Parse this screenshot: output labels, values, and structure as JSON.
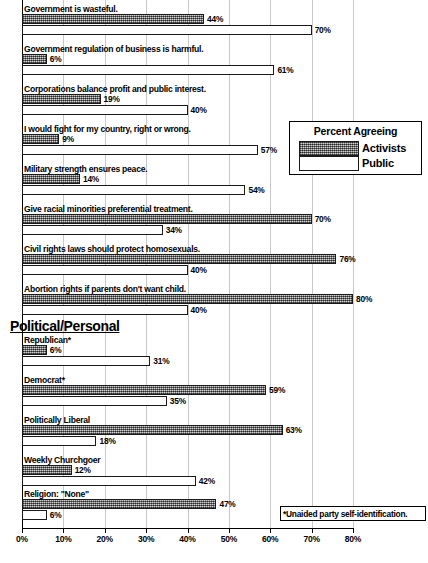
{
  "chart_data": {
    "type": "bar",
    "orientation": "horizontal",
    "title": "",
    "xlabel": "",
    "ylabel": "",
    "xlim": [
      0,
      80
    ],
    "grid": true,
    "grid_axis": "x",
    "legend": {
      "title": "Percent Agreeing",
      "position": "upper-right-inset",
      "entries": [
        {
          "name": "Activists",
          "fill": "hatched-gray",
          "color": "#9d9d9d"
        },
        {
          "name": "Public",
          "fill": "white",
          "color": "#ffffff"
        }
      ]
    },
    "x_ticks": [
      0,
      10,
      20,
      30,
      40,
      50,
      60,
      70,
      80
    ],
    "x_tick_labels": [
      "0%",
      "10%",
      "20%",
      "30%",
      "40%",
      "50%",
      "60%",
      "70%",
      "80%"
    ],
    "series": [
      {
        "name": "Activists",
        "values": [
          44,
          6,
          19,
          9,
          14,
          70,
          76,
          80,
          6,
          59,
          63,
          12,
          47
        ]
      },
      {
        "name": "Public",
        "values": [
          70,
          61,
          40,
          57,
          54,
          34,
          40,
          40,
          31,
          35,
          18,
          42,
          6
        ]
      }
    ],
    "categories": [
      "Government is wasteful.",
      "Government regulation of business is harmful.",
      "Corporations balance profit and public interest.",
      "I would fight for my country, right or wrong.",
      "Military strength ensures peace.",
      "Give racial minorities preferential treatment.",
      "Civil rights laws should protect homosexuals.",
      "Abortion rights if parents don't want child.",
      "Republican*",
      "Democrat*",
      "Politically Liberal",
      "Weekly Churchgoer",
      "Religion:  \"None\""
    ],
    "value_labels": {
      "activists": [
        "44%",
        "6%",
        "19%",
        "9%",
        "14%",
        "70%",
        "76%",
        "80%",
        "6%",
        "59%",
        "63%",
        "12%",
        "47%"
      ],
      "public": [
        "70%",
        "61%",
        "40%",
        "57%",
        "54%",
        "34%",
        "40%",
        "40%",
        "31%",
        "35%",
        "18%",
        "42%",
        "6%"
      ]
    },
    "section_headers": [
      {
        "label": "Political/Personal",
        "before_category_index": 8
      }
    ],
    "annotations": [
      {
        "name": "footnote",
        "text": "*Unaided party  self-identification."
      }
    ]
  },
  "rows": [
    {
      "label": "Government is wasteful.",
      "activists": 44,
      "public": 70,
      "activists_label": "44%",
      "public_label": "70%",
      "label_y": 4,
      "a_y": 14,
      "p_y": 25
    },
    {
      "label": "Government regulation of business is harmful.",
      "activists": 6,
      "public": 61,
      "activists_label": "6%",
      "public_label": "61%",
      "label_y": 44,
      "a_y": 54,
      "p_y": 65
    },
    {
      "label": "Corporations balance profit and public interest.",
      "activists": 19,
      "public": 40,
      "activists_label": "19%",
      "public_label": "40%",
      "label_y": 84,
      "a_y": 94,
      "p_y": 105
    },
    {
      "label": "I would fight for my country, right or wrong.",
      "activists": 9,
      "public": 57,
      "activists_label": "9%",
      "public_label": "57%",
      "label_y": 124,
      "a_y": 134,
      "p_y": 145
    },
    {
      "label": "Military strength ensures peace.",
      "activists": 14,
      "public": 54,
      "activists_label": "14%",
      "public_label": "54%",
      "label_y": 164,
      "a_y": 174,
      "p_y": 185
    },
    {
      "label": "Give racial minorities preferential treatment.",
      "activists": 70,
      "public": 34,
      "activists_label": "70%",
      "public_label": "34%",
      "label_y": 204,
      "a_y": 214,
      "p_y": 225
    },
    {
      "label": "Civil rights laws should protect homosexuals.",
      "activists": 76,
      "public": 40,
      "activists_label": "76%",
      "public_label": "40%",
      "label_y": 244,
      "a_y": 254,
      "p_y": 265
    },
    {
      "label": "Abortion rights if parents don't want child.",
      "activists": 80,
      "public": 40,
      "activists_label": "80%",
      "public_label": "40%",
      "label_y": 284,
      "a_y": 294,
      "p_y": 305
    },
    {
      "label": "Republican*",
      "activists": 6,
      "public": 31,
      "activists_label": "6%",
      "public_label": "31%",
      "label_y": 335,
      "a_y": 345,
      "p_y": 356
    },
    {
      "label": "Democrat*",
      "activists": 59,
      "public": 35,
      "activists_label": "59%",
      "public_label": "35%",
      "label_y": 375,
      "a_y": 385,
      "p_y": 396
    },
    {
      "label": "Politically Liberal",
      "activists": 63,
      "public": 18,
      "activists_label": "63%",
      "public_label": "18%",
      "label_y": 415,
      "a_y": 425,
      "p_y": 436
    },
    {
      "label": "Weekly Churchgoer",
      "activists": 12,
      "public": 42,
      "activists_label": "12%",
      "public_label": "42%",
      "label_y": 455,
      "a_y": 465,
      "p_y": 476
    },
    {
      "label": "Religion:  \"None\"",
      "activists": 47,
      "public": 6,
      "activists_label": "47%",
      "public_label": "6%",
      "label_y": 489,
      "a_y": 499,
      "p_y": 510
    }
  ],
  "section": {
    "label": "Political/Personal",
    "y": 318
  },
  "legend": {
    "title": "Percent Agreeing",
    "activists_label": "Activists",
    "public_label": "Public"
  },
  "footnote": {
    "text": "*Unaided party  self-identification."
  },
  "axis": {
    "ticks": [
      "0%",
      "10%",
      "20%",
      "30%",
      "40%",
      "50%",
      "60%",
      "70%",
      "80%"
    ]
  },
  "colors": {
    "activists_fill": "#9d9d9d",
    "public_fill": "#ffffff",
    "bar_border": "#1a1a1a",
    "gridline": "#c9c9c9",
    "axis": "#000000"
  }
}
